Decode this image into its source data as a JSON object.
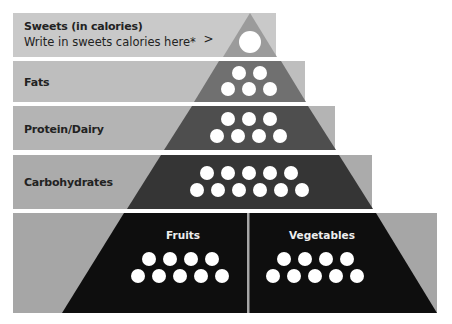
{
  "pyramid": {
    "levels": [
      {
        "id": "sweets",
        "label": "Sweets (in calories)",
        "sub_label": "Write in sweets calories here*",
        "chevron": ">",
        "servings": 1,
        "band_color": "#c9c9c9",
        "tri_color": "#9b9b9b"
      },
      {
        "id": "fats",
        "label": "Fats",
        "servings": 5,
        "band_color": "#bebebe",
        "tri_color": "#707070"
      },
      {
        "id": "protein",
        "label": "Protein/Dairy",
        "servings": 7,
        "band_color": "#b4b4b4",
        "tri_color": "#4e4e4e"
      },
      {
        "id": "carbs",
        "label": "Carbohydrates",
        "servings": 11,
        "band_color": "#ababab",
        "tri_color": "#353535"
      },
      {
        "id": "produce",
        "label": "",
        "band_color": "#a6a6a6",
        "tri_color": "#0e0e0e",
        "sections": [
          {
            "id": "fruits",
            "label": "Fruits",
            "servings": 9
          },
          {
            "id": "vegetables",
            "label": "Vegetables",
            "servings": 9
          }
        ]
      }
    ]
  }
}
